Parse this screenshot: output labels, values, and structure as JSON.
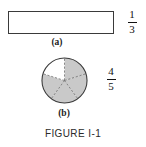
{
  "figure": {
    "caption": "FIGURE I-1",
    "parts": [
      {
        "id": "a",
        "label": "(a)",
        "shape": "rectangle",
        "divisions": 3,
        "shaded": 1,
        "fraction": {
          "numerator": "1",
          "denominator": "3"
        }
      },
      {
        "id": "b",
        "label": "(b)",
        "shape": "circle",
        "divisions": 5,
        "shaded": 4,
        "fraction": {
          "numerator": "4",
          "denominator": "5"
        }
      }
    ]
  },
  "colors": {
    "shade": "#c9c9c9",
    "outline": "#3a3a3a",
    "divider": "#4a4a4a",
    "text": "#1a1a1a",
    "background": "#ffffff"
  }
}
